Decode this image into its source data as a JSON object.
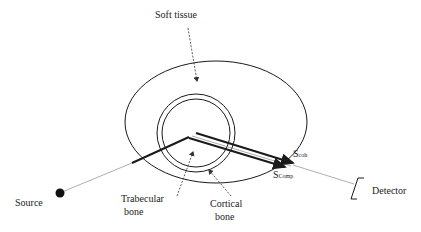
{
  "diagram": {
    "type": "x-ray scatter geometry",
    "labels": {
      "soft_tissue": "Soft tissue",
      "trabecular_line1": "Trabecular",
      "trabecular_line2": "bone",
      "cortical_line1": "Cortical",
      "cortical_line2": "bone",
      "source": "Source",
      "detector": "Detector",
      "s_coh_main": "S",
      "s_coh_sub": "coh",
      "s_comp_main": "S",
      "s_comp_sub": "Comp"
    },
    "colors": {
      "stroke": "#1a1a1a",
      "thin_beam": "#9a9a9a",
      "text": "#222222"
    }
  }
}
